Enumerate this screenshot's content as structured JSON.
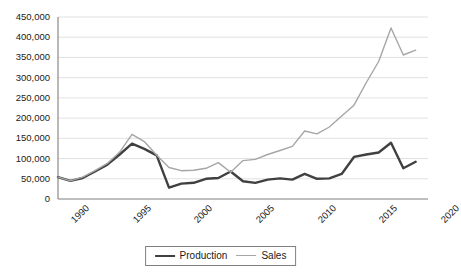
{
  "chart_data": {
    "type": "line",
    "title": "",
    "xlabel": "",
    "ylabel": "",
    "xlim": [
      1990,
      2020
    ],
    "ylim": [
      0,
      450000
    ],
    "ytick_step": 50000,
    "grid": true,
    "legend_position": "bottom-center",
    "x": [
      1990,
      1991,
      1992,
      1993,
      1994,
      1995,
      1996,
      1997,
      1998,
      1999,
      2000,
      2001,
      2002,
      2003,
      2004,
      2005,
      2006,
      2007,
      2008,
      2009,
      2010,
      2011,
      2012,
      2013,
      2014,
      2015,
      2016,
      2017,
      2018,
      2019
    ],
    "xtick_labels": [
      "1990",
      "1995",
      "2000",
      "2005",
      "2010",
      "2015",
      "2020"
    ],
    "xticks": [
      1990,
      1995,
      2000,
      2005,
      2010,
      2015,
      2020
    ],
    "ytick_labels": [
      "0",
      "50,000",
      "100,000",
      "150,000",
      "200,000",
      "250,000",
      "300,000",
      "350,000",
      "400,000",
      "450,000"
    ],
    "yticks": [
      0,
      50000,
      100000,
      150000,
      200000,
      250000,
      300000,
      350000,
      400000,
      450000
    ],
    "series": [
      {
        "name": "Production",
        "color": "#404040",
        "width": 2.4,
        "values": [
          54000,
          45000,
          52000,
          68000,
          85000,
          110000,
          137000,
          124000,
          108000,
          28000,
          38000,
          40000,
          50000,
          52000,
          68000,
          44000,
          40000,
          48000,
          51000,
          48000,
          62000,
          50000,
          51000,
          62000,
          104000,
          110000,
          115000,
          139000,
          76000,
          92000
        ]
      },
      {
        "name": "Sales",
        "color": "#a6a6a6",
        "width": 1.4,
        "values": [
          54000,
          45000,
          54000,
          70000,
          88000,
          116000,
          160000,
          142000,
          108000,
          78000,
          70000,
          71000,
          76000,
          90000,
          66000,
          95000,
          98000,
          110000,
          120000,
          130000,
          168000,
          161000,
          178000,
          205000,
          232000,
          288000,
          340000,
          423000,
          356000,
          368000
        ]
      }
    ]
  },
  "legend": {
    "items": [
      {
        "label": "Production"
      },
      {
        "label": "Sales"
      }
    ]
  }
}
